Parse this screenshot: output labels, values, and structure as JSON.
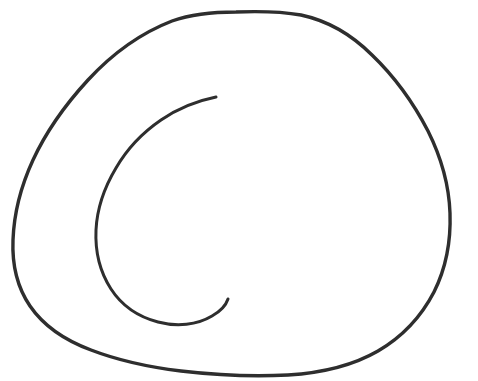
{
  "document": {
    "type": "hand-drawn-sketch",
    "title": "Hand-drawn spiral doodle",
    "background_color": "#ffffff",
    "width": 478,
    "height": 381
  },
  "drawing": {
    "subject": "spiral",
    "description": "A hand-drawn spiral: a large irregular rounded outer contour enclosing an inner open C-shaped arc, drawn in dark ink on a white background.",
    "ink_color": "#2e2e2e",
    "stroke_width": 3.2,
    "stroke_count": 2,
    "strokes": [
      {
        "name": "outer-contour",
        "label": "Outer spiral loop",
        "closed": false,
        "stroke_width": 3.4,
        "path": "M 236 12 C 262 11 284 12 301 15 C 329 21 352 35 372 55 C 396 78 414 104 428 131 C 441 157 449 185 450 213 C 451 241 446 268 434 292 C 421 317 402 337 378 351 C 352 366 321 373 288 375 C 252 377 215 375 181 371 C 148 367 117 360 91 350 C 64 340 43 325 30 306 C 17 287 12 264 13 240 C 14 213 21 186 33 160 C 46 132 65 105 88 80 C 112 54 141 33 172 21 C 192 14 214 12 236 12 Z"
      },
      {
        "name": "inner-arc",
        "label": "Inner C-shaped spiral arc",
        "closed": false,
        "stroke_width": 3.0,
        "path": "M 216 97 C 196 101 177 109 161 120 C 142 133 127 149 116 168 C 104 188 97 209 96 230 C 95 252 100 272 111 289 C 122 306 139 317 158 322 C 177 327 197 325 212 316 C 221 311 226 305 228 299"
      }
    ],
    "terminals": [
      {
        "name": "inner-arc-start-tip",
        "x": 216,
        "y": 97,
        "note": "thickened pen-down blob"
      },
      {
        "name": "inner-arc-end-tip",
        "x": 228,
        "y": 299,
        "note": "upward curl at pen-up"
      }
    ],
    "extents": {
      "outer_top_y": 12,
      "outer_bottom_y": 375,
      "outer_left_x": 13,
      "outer_right_x": 451,
      "inner_left_x": 95,
      "inner_top_y": 97,
      "inner_bottom_y": 325
    }
  }
}
